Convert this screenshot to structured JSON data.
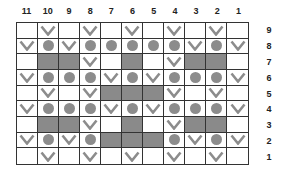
{
  "chart": {
    "column_labels": [
      "11",
      "10",
      "9",
      "8",
      "7",
      "6",
      "5",
      "4",
      "3",
      "2",
      "1"
    ],
    "row_labels": [
      "9",
      "8",
      "7",
      "6",
      "5",
      "4",
      "3",
      "2",
      "1"
    ],
    "legend_symbols": {
      "E": "empty",
      "V": "v-mark",
      "D": "gray-dot",
      "G": "gray-fill"
    },
    "colors": {
      "grid_line": "#333333",
      "fill": "#8a8a8a",
      "symbol": "#8c8c8c"
    },
    "rows": [
      [
        "E",
        "V",
        "E",
        "V",
        "E",
        "V",
        "E",
        "V",
        "E",
        "V",
        "E"
      ],
      [
        "V",
        "D",
        "V",
        "D",
        "D",
        "D",
        "D",
        "D",
        "V",
        "D",
        "V"
      ],
      [
        "E",
        "G",
        "G",
        "V",
        "E",
        "G",
        "E",
        "V",
        "G",
        "G",
        "E"
      ],
      [
        "V",
        "D",
        "D",
        "D",
        "V",
        "D",
        "V",
        "D",
        "D",
        "D",
        "V"
      ],
      [
        "E",
        "V",
        "E",
        "V",
        "G",
        "G",
        "G",
        "V",
        "E",
        "V",
        "E"
      ],
      [
        "V",
        "D",
        "D",
        "D",
        "V",
        "D",
        "V",
        "D",
        "D",
        "D",
        "V"
      ],
      [
        "E",
        "G",
        "G",
        "V",
        "E",
        "G",
        "E",
        "V",
        "G",
        "G",
        "E"
      ],
      [
        "V",
        "D",
        "V",
        "D",
        "G",
        "G",
        "G",
        "D",
        "V",
        "D",
        "V"
      ],
      [
        "E",
        "V",
        "E",
        "V",
        "E",
        "V",
        "E",
        "V",
        "E",
        "V",
        "E"
      ]
    ]
  }
}
